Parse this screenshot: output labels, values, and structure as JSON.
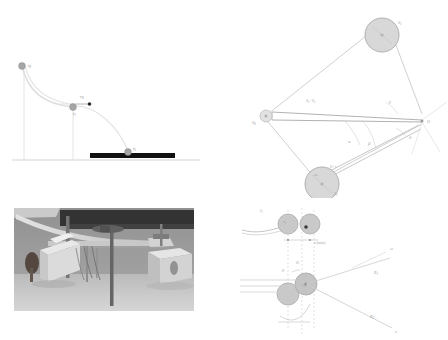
{
  "figure": {
    "background_color": "#ffffff",
    "panels": [
      {
        "id": "trajectory",
        "name": "ball-trajectory-diagram",
        "description": "Ball falling along a curved guide then undergoing projectile motion onto a black landing pad"
      },
      {
        "id": "linkage",
        "name": "four-bar-linkage-diagram",
        "description": "Kinematic diagram with two pulleys, a long bar and labelled angles about pivot O"
      },
      {
        "id": "photo",
        "name": "laboratory-apparatus-photograph",
        "description": "Grayscale photograph of the experimental rig on a bench"
      },
      {
        "id": "pulley",
        "name": "pulley-pair-schematic",
        "description": "Schematic of paired rollers with cord, offsets and angular markings"
      }
    ]
  },
  "trajectory": {
    "labels": {
      "start": "t",
      "start_sub": "0",
      "release": "t",
      "release_sub": "1",
      "impact": "t",
      "impact_sub": "2",
      "velocity": "v",
      "velocity_sub": "0"
    },
    "colors": {
      "ball": "#a6a6a6",
      "ball_stroke": "#8c8c8c",
      "path": "#d8d8d8",
      "pad": "#111111",
      "ground": "#d0d0d0",
      "guide": "#dcdcdc"
    },
    "points": {
      "t0": [
        22,
        66
      ],
      "t1": [
        73,
        106
      ],
      "t2": [
        128,
        152
      ],
      "v0_arrow_tip": [
        89,
        104
      ]
    }
  },
  "linkage": {
    "labels": {
      "pulley_top": "S",
      "pulley_top_sub": "1",
      "pulley_bottom": "S",
      "pulley_bottom_sub": "2",
      "left_vertex": "S",
      "left_vertex_sub": "0",
      "bar_label": "S₀+S₂",
      "bottom_bar_label": "S+r",
      "pivot": "O",
      "angle_alpha": "α",
      "angle_beta": "β",
      "angle_gamma": "γ",
      "angle_delta": "δ",
      "angle_small": "ω"
    },
    "colors": {
      "line": "#c9c9c9",
      "bar": "#b5b5b5",
      "pulley_fill": "#d6d6d6",
      "pulley_stroke": "#a8a8a8",
      "text": "#9a9a9a"
    },
    "points": {
      "S0": [
        42,
        116
      ],
      "O": [
        330,
        118
      ],
      "S1": [
        165,
        35
      ],
      "S2": [
        95,
        180
      ]
    }
  },
  "pulley": {
    "labels": {
      "cord": "l",
      "cord_sub": "1",
      "roller_top_left": "r",
      "roller_top_left_sub": "1",
      "gap_label": "e (mm)",
      "center_label": "O",
      "omega": "ω",
      "radius_1": "R",
      "radius_1_sub": "1",
      "radius_2": "R",
      "radius_2_sub": "2",
      "axis_x": "x",
      "angle_mark": "θ",
      "roller_lower": "r",
      "roller_lower_sub": "2"
    },
    "colors": {
      "roller_fill": "#c9c9c9",
      "roller_stroke": "#a9a9a9",
      "line": "#c4c4c4",
      "dash": "#cfcfcf",
      "text": "#a0a0a0"
    }
  },
  "photo": {
    "alt_text": "Grayscale photograph of a laboratory bench with a curved launch ramp, support frame, wooden blocks and instrument box",
    "tone": {
      "background": "#8f8f8f",
      "dark_band": "#2e2e2e",
      "mid": "#a5a5a5",
      "light": "#d8d8d8",
      "floor": "#c2c2c2"
    }
  }
}
